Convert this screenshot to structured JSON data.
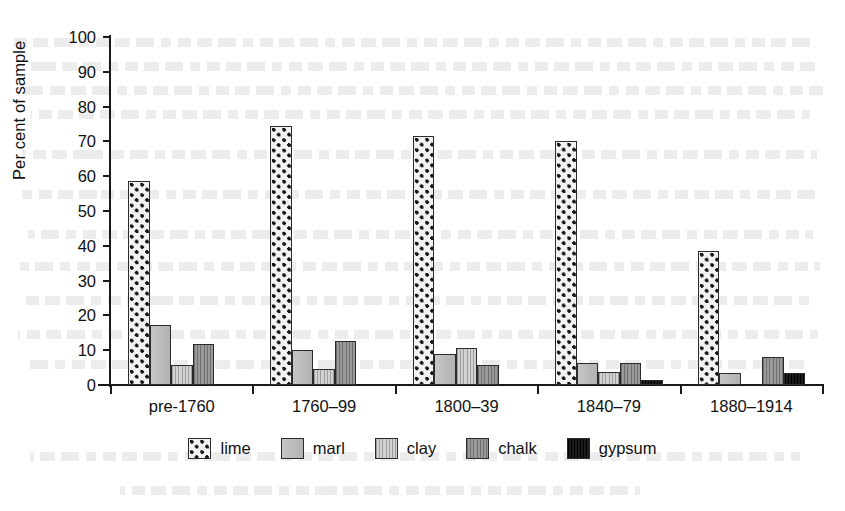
{
  "chart_data": {
    "type": "bar",
    "title": "",
    "subtitle": "",
    "xlabel": "",
    "ylabel": "Per cent of sample",
    "ylim": [
      0,
      100
    ],
    "ytick_step": 10,
    "yticks": [
      0,
      10,
      20,
      30,
      40,
      50,
      60,
      70,
      80,
      90,
      100
    ],
    "grid": false,
    "legend_position": "bottom",
    "categories": [
      "pre-1760",
      "1760–99",
      "1800–39",
      "1840–79",
      "1880–1914"
    ],
    "series": [
      {
        "name": "lime",
        "values": [
          58.5,
          74.4,
          71.5,
          70.0,
          38.5
        ],
        "color": "#f2f2f0",
        "pattern": "checker-dots"
      },
      {
        "name": "marl",
        "values": [
          17.3,
          10.0,
          9.0,
          6.3,
          3.5
        ],
        "color": "#b9b9b9",
        "pattern": "solid-light-gray"
      },
      {
        "name": "clay",
        "values": [
          5.8,
          4.7,
          10.7,
          3.8,
          0.0
        ],
        "color": "#c4c4c4",
        "pattern": "vertical-stripes-light"
      },
      {
        "name": "chalk",
        "values": [
          11.8,
          12.7,
          5.8,
          6.3,
          8.0
        ],
        "color": "#8e8e8e",
        "pattern": "vertical-stripes-dark"
      },
      {
        "name": "gypsum",
        "values": [
          0.0,
          0.0,
          0.0,
          1.5,
          3.4
        ],
        "color": "#0d0d0d",
        "pattern": "solid-black"
      }
    ]
  },
  "legend": {
    "items": [
      {
        "label": "lime"
      },
      {
        "label": "marl"
      },
      {
        "label": "clay"
      },
      {
        "label": "chalk"
      },
      {
        "label": "gypsum"
      }
    ]
  }
}
